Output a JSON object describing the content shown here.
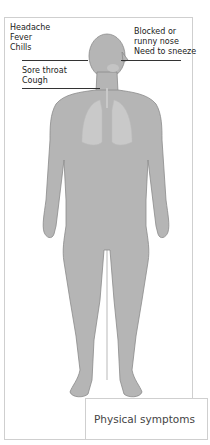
{
  "diagram": {
    "title": "Physical symptoms",
    "colors": {
      "body_fill": "#b5b5b5",
      "body_outline": "#8a8a8a",
      "lungs": "#c9c9c9",
      "leader_line": "#333333",
      "frame_border": "#cfcfcf"
    },
    "labels": {
      "head": [
        "Headache",
        "Fever",
        "Chills"
      ],
      "nose": [
        "Blocked or",
        "runny nose",
        "Need to sneeze"
      ],
      "throat": [
        "Sore throat",
        "Cough"
      ]
    }
  }
}
